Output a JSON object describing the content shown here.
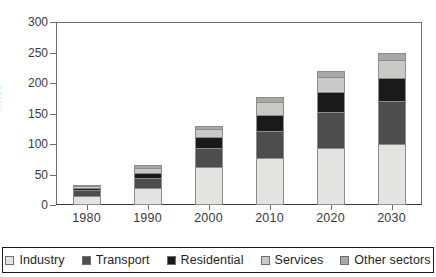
{
  "chart_data": {
    "type": "bar",
    "stacked": true,
    "title": "",
    "xlabel": "",
    "ylabel": "Mtoe",
    "ylim": [
      0,
      300
    ],
    "yticks": [
      0,
      50,
      100,
      150,
      200,
      250,
      300
    ],
    "grid": false,
    "legend_position": "bottom",
    "categories": [
      "1980",
      "1990",
      "2000",
      "2010",
      "2020",
      "2030"
    ],
    "series": [
      {
        "name": "Industry",
        "color": "#e3e3e1",
        "values": [
          14,
          28,
          62,
          77,
          93,
          100
        ]
      },
      {
        "name": "Transport",
        "color": "#4d4d4d",
        "values": [
          10,
          16,
          31,
          45,
          59,
          71
        ]
      },
      {
        "name": "Residential",
        "color": "#1a1a1a",
        "values": [
          4,
          9,
          18,
          26,
          33,
          37
        ]
      },
      {
        "name": "Services",
        "color": "#c9c9c7",
        "values": [
          3,
          8,
          13,
          21,
          25,
          30
        ]
      },
      {
        "name": "Other sectors",
        "color": "#a8a8a6",
        "values": [
          1,
          4,
          6,
          8,
          10,
          12
        ]
      }
    ],
    "totals": [
      32,
      65,
      130,
      177,
      220,
      250
    ]
  },
  "axes": {
    "y_title": "Mtoe",
    "y_tick_labels": [
      "0",
      "50",
      "100",
      "150",
      "200",
      "250",
      "300"
    ],
    "x_tick_labels": [
      "1980",
      "1990",
      "2000",
      "2010",
      "2020",
      "2030"
    ]
  },
  "legend": {
    "items": [
      {
        "label": "Industry",
        "color": "#e3e3e1",
        "name": "legend-industry"
      },
      {
        "label": "Transport",
        "color": "#4d4d4d",
        "name": "legend-transport"
      },
      {
        "label": "Residential",
        "color": "#1a1a1a",
        "name": "legend-residential"
      },
      {
        "label": "Services",
        "color": "#c9c9c7",
        "name": "legend-services"
      },
      {
        "label": "Other sectors",
        "color": "#a8a8a6",
        "name": "legend-other-sectors"
      }
    ]
  }
}
